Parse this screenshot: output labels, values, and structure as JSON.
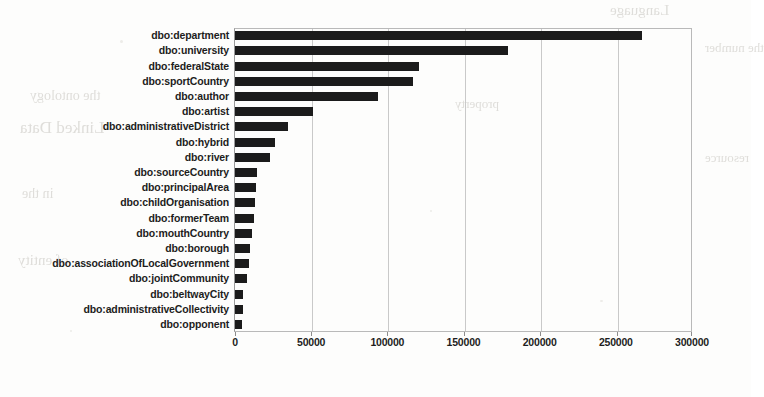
{
  "chart_data": {
    "type": "bar",
    "orientation": "horizontal",
    "title": "",
    "subtitle": "",
    "xlabel": "",
    "ylabel": "",
    "xlim": [
      0,
      300000
    ],
    "ylim": null,
    "grid": true,
    "legend": null,
    "legend_position": "none",
    "bar_color": "#1b1b1b",
    "background_color": "#fdfdfc",
    "xticks": [
      0,
      50000,
      100000,
      150000,
      200000,
      250000,
      300000
    ],
    "xtick_labels": [
      "0",
      "50000",
      "100000",
      "150000",
      "200000",
      "250000",
      "300000"
    ],
    "categories": [
      "dbo:department",
      "dbo:university",
      "dbo:federalState",
      "dbo:sportCountry",
      "dbo:author",
      "dbo:artist",
      "dbo:administrativeDistrict",
      "dbo:hybrid",
      "dbo:river",
      "dbo:sourceCountry",
      "dbo:principalArea",
      "dbo:childOrganisation",
      "dbo:formerTeam",
      "dbo:mouthCountry",
      "dbo:borough",
      "dbo:associationOfLocalGovernment",
      "dbo:jointCommunity",
      "dbo:beltwayCity",
      "dbo:administrativeCollectivity",
      "dbo:opponent"
    ],
    "values": [
      267000,
      179000,
      121000,
      117000,
      94000,
      51000,
      35000,
      26000,
      23000,
      14300,
      13600,
      13000,
      12300,
      11000,
      9700,
      9100,
      7800,
      5200,
      5000,
      4500
    ],
    "annotations": []
  },
  "figure": {
    "name": "horizontal-bar-chart",
    "axis_color": "#9a9a9a",
    "grid_color": "#c9c9c9",
    "tick_font_size_px": 10.5
  },
  "scan_artifacts": {
    "ghost_texts": [
      "Language",
      "the ontology",
      "Linked Data",
      "property",
      "the number",
      "in the",
      "of entity",
      "resource"
    ]
  }
}
